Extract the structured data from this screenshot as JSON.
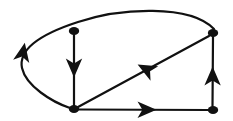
{
  "figure": {
    "kind": "directed-graph",
    "title": "",
    "width": 233,
    "height": 121,
    "background_color": "#ffffff",
    "ink_color": "#111111"
  },
  "graph": {
    "node_count": 4,
    "edge_count": 5,
    "directed": true,
    "node_radius": 5.2,
    "node_radius_y": 4.0,
    "edge_stroke_width": 2.2,
    "nodes": [
      {
        "id": "n-top-middle",
        "label": "",
        "cx": 74,
        "cy": 31
      },
      {
        "id": "n-top-right",
        "label": "",
        "cx": 213,
        "cy": 33
      },
      {
        "id": "n-bottom-left",
        "label": "",
        "cx": 74,
        "cy": 109
      },
      {
        "id": "n-bottom-right",
        "label": "",
        "cx": 213,
        "cy": 110
      }
    ],
    "edges": [
      {
        "id": "edge-topmiddle-to-bottomleft",
        "from": "n-top-middle",
        "to": "n-bottom-left",
        "shape": "line",
        "path": "M 74 35 L 74 106",
        "arrow_at": {
          "x": 74,
          "y": 68,
          "angle": 90
        }
      },
      {
        "id": "edge-topright-to-bottomleft-diagonal",
        "from": "n-top-right",
        "to": "n-bottom-left",
        "shape": "line",
        "path": "M 209 36 L 78 107",
        "arrow_at": {
          "x": 146,
          "y": 69,
          "angle": 208
        }
      },
      {
        "id": "edge-bottomleft-to-bottomright",
        "from": "n-bottom-left",
        "to": "n-bottom-right",
        "shape": "line",
        "path": "M 79 109.5 L 209 110",
        "arrow_at": {
          "x": 147,
          "y": 109.8,
          "angle": 0
        }
      },
      {
        "id": "edge-bottomright-to-topright",
        "from": "n-bottom-right",
        "to": "n-top-right",
        "shape": "line",
        "path": "M 212.5 106 L 213 37",
        "arrow_at": {
          "x": 212.6,
          "y": 76,
          "angle": 270
        }
      },
      {
        "id": "edge-topright-to-bottomleft-curve",
        "from": "n-top-right",
        "to": "n-bottom-left",
        "shape": "curve",
        "path": "M 214 29 C 190 4 120 8 78 22 C 44 33 18 48 22 68 C 26 86 52 102 70 108",
        "arrow_at": {
          "x": 23,
          "y": 52,
          "angle": 281
        }
      }
    ]
  }
}
